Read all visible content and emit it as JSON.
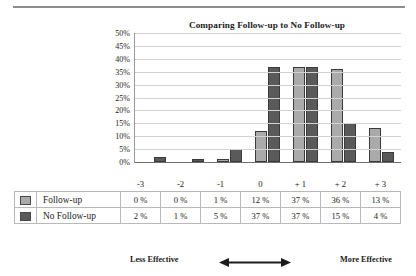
{
  "chart_data": {
    "type": "bar",
    "title": "Comparing Follow-up to No Follow-up",
    "xlabel": "",
    "ylabel": "",
    "categories": [
      "-3",
      "-2",
      "-1",
      "0",
      "+ 1",
      "+ 2",
      "+ 3"
    ],
    "series": [
      {
        "name": "Follow-up",
        "values": [
          0,
          0,
          1,
          12,
          37,
          36,
          13
        ],
        "color": "#aaaaaa"
      },
      {
        "name": "No Follow-up",
        "values": [
          2,
          1,
          5,
          37,
          37,
          15,
          4
        ],
        "color": "#5a5a5a"
      }
    ],
    "value_labels": {
      "Follow-up": [
        "0 %",
        "0 %",
        "1 %",
        "12 %",
        "37 %",
        "36 %",
        "13 %"
      ],
      "No Follow-up": [
        "2 %",
        "1 %",
        "5 %",
        "37 %",
        "37 %",
        "15 %",
        "4 %"
      ]
    },
    "ylim": [
      0,
      50
    ],
    "ytick_step": 5,
    "ytick_labels": [
      "50%",
      "45%",
      "40%",
      "35%",
      "30%",
      "25%",
      "20%",
      "15%",
      "10%",
      "5%",
      "0%"
    ],
    "grid": true,
    "legend_position": "data-table-left"
  },
  "footer": {
    "left_label": "Less Effective",
    "right_label": "More Effective",
    "arrow_icon": "double-headed-horizontal-arrow"
  },
  "colors": {
    "series_light": "#aaaaaa",
    "series_dark": "#5a5a5a",
    "gridline": "#d2d2d2",
    "table_border": "#b9b9b9",
    "text": "#1b1b1b"
  }
}
